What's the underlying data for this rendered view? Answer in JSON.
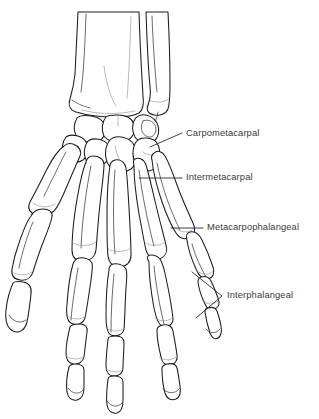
{
  "figure": {
    "background_color": "#ffffff",
    "line_color": "#1c1c1c",
    "label_color": "#3b3b3b"
  },
  "labels": [
    {
      "id": "carpometacarpal",
      "text": "Carpometacarpal",
      "x": 186,
      "y": 134,
      "leader": "M 150 147 L 182 133"
    },
    {
      "id": "intermetacarpal",
      "text": "Intermetacarpal",
      "x": 186,
      "y": 178,
      "leader": "M 139 178 L 182 178"
    },
    {
      "id": "metacarpophalangeal",
      "text": "Metacarpophalangeal",
      "x": 207,
      "y": 228,
      "leader": "M 171 228 L 203 228"
    },
    {
      "id": "interphalangeal",
      "text": "Interphalangeal",
      "x": 227,
      "y": 296,
      "leader": "M 192 272 L 222 296 L 196 318"
    }
  ],
  "anatomy": {
    "forearm": [
      "radius",
      "ulna"
    ],
    "carpal_rows": [
      "proximal row",
      "distal row"
    ],
    "digits": [
      "thumb",
      "index",
      "middle",
      "ring",
      "little"
    ],
    "phalanges_per_finger": [
      "proximal",
      "middle",
      "distal"
    ],
    "phalanges_thumb": [
      "proximal",
      "distal"
    ]
  }
}
